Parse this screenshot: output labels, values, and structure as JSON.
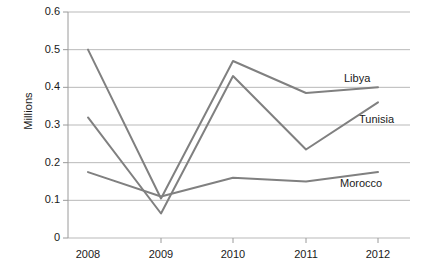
{
  "chart_data": {
    "type": "line",
    "title": "",
    "xlabel": "",
    "ylabel": "Millions",
    "categories": [
      "2008",
      "2009",
      "2010",
      "2011",
      "2012"
    ],
    "x": [
      2008,
      2009,
      2010,
      2011,
      2012
    ],
    "ylim": [
      0,
      0.6
    ],
    "ytick_labels": [
      "0",
      "0.1",
      "0.2",
      "0.3",
      "0.4",
      "0.5",
      "0.6"
    ],
    "ytick_values": [
      0,
      0.1,
      0.2,
      0.3,
      0.4,
      0.5,
      0.6
    ],
    "grid": "horizontal",
    "legend_position": "inline-right-end-labels",
    "series": [
      {
        "name": "Libya",
        "values": [
          0.5,
          0.105,
          0.47,
          0.385,
          0.4
        ],
        "color": "#808080"
      },
      {
        "name": "Tunisia",
        "values": [
          0.32,
          0.065,
          0.43,
          0.235,
          0.36
        ],
        "color": "#808080"
      },
      {
        "name": "Morocco",
        "values": [
          0.175,
          0.11,
          0.16,
          0.15,
          0.175
        ],
        "color": "#808080"
      }
    ],
    "annotations": [
      {
        "text": "Libya",
        "series": "Libya"
      },
      {
        "text": "Tunisia",
        "series": "Tunisia"
      },
      {
        "text": "Morocco",
        "series": "Morocco"
      }
    ],
    "colors": {
      "line": "#808080",
      "grid": "#b9b9b9",
      "axis": "#9a9a9a",
      "text": "#1a1a1a",
      "background": "#ffffff"
    }
  }
}
